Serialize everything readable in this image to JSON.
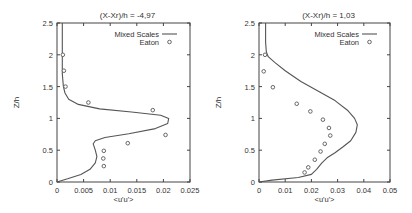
{
  "chart_data": [
    {
      "type": "line",
      "title": "(X-Xr)/h = -4,97",
      "xlabel": "<u'u'>",
      "ylabel": "Z/h",
      "xlim": [
        0,
        0.025
      ],
      "ylim": [
        0,
        2.5
      ],
      "xticks": [
        "0",
        "0.005",
        "0.01",
        "0.015",
        "0.02",
        "0.025"
      ],
      "yticks": [
        "0",
        "0.5",
        "1",
        "1.5",
        "2",
        "2.5"
      ],
      "grid": false,
      "legend_position": "top-right",
      "series": [
        {
          "name": "Mixed Scales",
          "style": "line",
          "x": [
            0,
            0.002,
            0.0045,
            0.0062,
            0.0072,
            0.0075,
            0.0072,
            0.0068,
            0.0072,
            0.009,
            0.0135,
            0.0185,
            0.0208,
            0.021,
            0.0195,
            0.014,
            0.008,
            0.004,
            0.0022,
            0.0015,
            0.0012,
            0.001,
            0.001
          ],
          "y": [
            0,
            0.05,
            0.12,
            0.2,
            0.3,
            0.4,
            0.5,
            0.6,
            0.65,
            0.7,
            0.76,
            0.84,
            0.92,
            1.0,
            1.05,
            1.1,
            1.15,
            1.22,
            1.3,
            1.4,
            1.5,
            1.7,
            2.5
          ]
        },
        {
          "name": "Eaton",
          "style": "markers",
          "x": [
            0.0011,
            0.0013,
            0.0016,
            0.0059,
            0.018,
            0.0204,
            0.0133,
            0.0088,
            0.0087,
            0.0088
          ],
          "y": [
            2.0,
            1.75,
            1.5,
            1.25,
            1.13,
            0.74,
            0.61,
            0.49,
            0.37,
            0.25
          ]
        }
      ]
    },
    {
      "type": "line",
      "title": "(X-Xr)/h = 1,03",
      "xlabel": "<u'u'>",
      "ylabel": "Z/h",
      "xlim": [
        0,
        0.05
      ],
      "ylim": [
        0,
        2.5
      ],
      "xticks": [
        "0",
        "0.01",
        "0.02",
        "0.03",
        "0.04",
        "0.05"
      ],
      "yticks": [
        "0",
        "0.5",
        "1",
        "1.5",
        "2",
        "2.5"
      ],
      "grid": false,
      "legend_position": "top-right",
      "series": [
        {
          "name": "Mixed Scales",
          "style": "line",
          "x": [
            0,
            0.005,
            0.015,
            0.02,
            0.022,
            0.024,
            0.026,
            0.029,
            0.032,
            0.035,
            0.037,
            0.0375,
            0.0365,
            0.034,
            0.029,
            0.023,
            0.016,
            0.01,
            0.006,
            0.0035,
            0.0028,
            0.0025,
            0.0025
          ],
          "y": [
            0,
            0.03,
            0.07,
            0.12,
            0.2,
            0.3,
            0.38,
            0.46,
            0.55,
            0.65,
            0.78,
            0.9,
            1.0,
            1.12,
            1.28,
            1.42,
            1.58,
            1.75,
            1.88,
            1.97,
            2.05,
            2.2,
            2.5
          ]
        },
        {
          "name": "Eaton",
          "style": "markers",
          "x": [
            0.0023,
            0.0018,
            0.0053,
            0.0144,
            0.0196,
            0.0244,
            0.0267,
            0.0272,
            0.0251,
            0.0235,
            0.0213,
            0.0188,
            0.0174
          ],
          "y": [
            2.0,
            1.74,
            1.49,
            1.23,
            1.11,
            0.98,
            0.85,
            0.73,
            0.6,
            0.48,
            0.35,
            0.23,
            0.15
          ]
        }
      ]
    }
  ],
  "panels": [
    {
      "title": "(X-Xr)/h = -4,97",
      "xlabel": "<u'u'>",
      "ylabel": "Z/h",
      "legend": [
        "Mixed Scales",
        "Eaton"
      ],
      "xticks": [
        "0",
        "0.005",
        "0.01",
        "0.015",
        "0.02",
        "0.025"
      ],
      "yticks": [
        "0",
        "0.5",
        "1",
        "1.5",
        "2",
        "2.5"
      ]
    },
    {
      "title": "(X-Xr)/h = 1,03",
      "xlabel": "<u'u'>",
      "ylabel": "Z/h",
      "legend": [
        "Mixed Scales",
        "Eaton"
      ],
      "xticks": [
        "0",
        "0.01",
        "0.02",
        "0.03",
        "0.04",
        "0.05"
      ],
      "yticks": [
        "0",
        "0.5",
        "1",
        "1.5",
        "2",
        "2.5"
      ]
    }
  ],
  "colors": {
    "line": "#555555",
    "marker": "#666666",
    "axis": "#444444"
  }
}
